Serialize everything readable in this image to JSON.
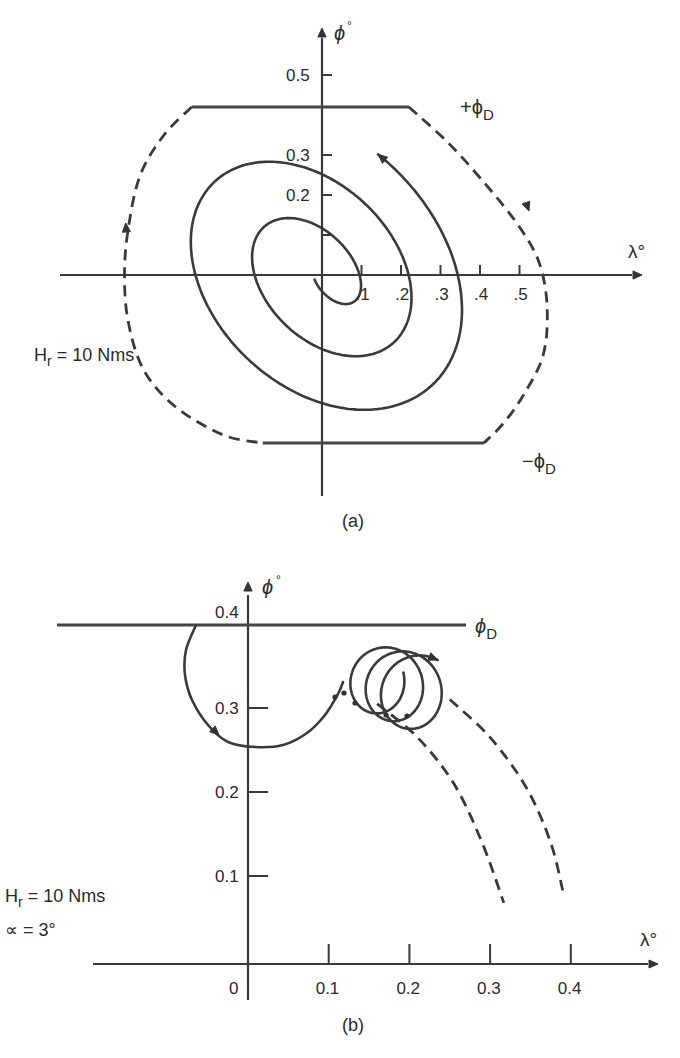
{
  "chart_data": [
    {
      "id": "a",
      "type": "line",
      "caption": "(a)",
      "xlabel": "λ°",
      "ylabel": "ϕ°",
      "xticks": [
        0.1,
        0.2,
        0.3,
        0.4,
        0.5
      ],
      "xtick_labels": [
        ".1",
        ".2",
        ".3",
        ".4",
        ".5"
      ],
      "yticks": [
        0.1,
        0.2,
        0.3,
        0.5
      ],
      "ytick_labels": [
        "",
        "0.2",
        "0.3",
        "0.5"
      ],
      "xlim": [
        -0.66,
        0.8
      ],
      "ylim": [
        -0.56,
        0.62
      ],
      "annotation": {
        "text": "H",
        "sub": "r",
        "rest": " = 10 Nms"
      },
      "deadband": {
        "upper": 0.42,
        "lower": -0.42,
        "upper_label": "+ϕ",
        "lower_label": "−ϕ",
        "sub": "D"
      },
      "upper_line": {
        "x": [
          -0.33,
          0.22
        ]
      },
      "lower_line": {
        "x": [
          -0.15,
          0.41
        ]
      },
      "dashed_boundary": [
        [
          -0.33,
          0.42
        ],
        [
          -0.4,
          0.35
        ],
        [
          -0.46,
          0.25
        ],
        [
          -0.49,
          0.12
        ],
        [
          -0.5,
          0.0
        ],
        [
          -0.49,
          -0.12
        ],
        [
          -0.45,
          -0.24
        ],
        [
          -0.37,
          -0.33
        ],
        [
          -0.25,
          -0.4
        ],
        [
          -0.15,
          -0.42
        ]
      ],
      "dashed_boundary_right": [
        [
          0.22,
          0.42
        ],
        [
          0.32,
          0.33
        ],
        [
          0.42,
          0.22
        ],
        [
          0.5,
          0.12
        ],
        [
          0.55,
          0.03
        ],
        [
          0.57,
          -0.08
        ],
        [
          0.56,
          -0.2
        ],
        [
          0.51,
          -0.3
        ],
        [
          0.46,
          -0.37
        ],
        [
          0.41,
          -0.42
        ]
      ],
      "spiral": {
        "start": [
          0.03,
          -0.07
        ],
        "description": "counter-clockwise expanding spiral tilted along -45°",
        "axis_crossings_x": [
          -0.1,
          0.165,
          -0.225,
          0.28,
          -0.35
        ],
        "axis_crossings_y": [
          0.12,
          0.26,
          0.385
        ],
        "end": [
          0.24,
          0.25
        ]
      }
    },
    {
      "id": "b",
      "type": "line",
      "caption": "(b)",
      "xlabel": "λ°",
      "ylabel": "ϕ°",
      "xticks": [
        0,
        0.1,
        0.2,
        0.3,
        0.4
      ],
      "xtick_labels": [
        "0",
        "0.1",
        "0.2",
        "0.3",
        "0.4"
      ],
      "yticks": [
        0.1,
        0.2,
        0.3,
        0.4
      ],
      "ytick_labels": [
        "0.1",
        "0.2",
        "0.3",
        "0.4"
      ],
      "xlim": [
        -0.2,
        0.5
      ],
      "ylim": [
        0,
        0.45
      ],
      "annotation_lines": [
        {
          "text": "H",
          "sub": "r",
          "rest": " = 10 Nms"
        },
        {
          "text": "∝ = 3°",
          "sub": "",
          "rest": ""
        }
      ],
      "deadband": {
        "value": 0.39,
        "label": "ϕ",
        "sub": "D",
        "x": [
          -0.2,
          0.27
        ]
      },
      "trajectory": {
        "start": [
          -0.063,
          0.39
        ],
        "bottom": [
          0.01,
          0.254
        ],
        "loop_entry": [
          0.116,
          0.337
        ],
        "loops": [
          {
            "center": [
              0.155,
              0.335
            ],
            "r": 0.04
          },
          {
            "center": [
              0.183,
              0.33
            ],
            "r": 0.042
          },
          {
            "center": [
              0.205,
              0.325
            ],
            "r": 0.043
          }
        ]
      },
      "dashed_curves": [
        {
          "name": "inner",
          "points": [
            [
              0.16,
              0.305
            ],
            [
              0.21,
              0.265
            ],
            [
              0.255,
              0.21
            ],
            [
              0.29,
              0.14
            ],
            [
              0.317,
              0.068
            ]
          ]
        },
        {
          "name": "outer",
          "points": [
            [
              0.25,
              0.31
            ],
            [
              0.3,
              0.265
            ],
            [
              0.345,
              0.205
            ],
            [
              0.375,
              0.14
            ],
            [
              0.39,
              0.083
            ]
          ]
        }
      ]
    }
  ]
}
